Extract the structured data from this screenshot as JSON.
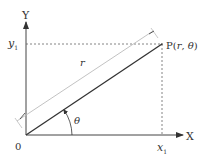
{
  "diagram": {
    "axes": {
      "x_label": "X",
      "y_label": "Y",
      "origin_label": "0"
    },
    "point": {
      "label_prefix": "P(",
      "r": "r",
      "sep": ", ",
      "theta": "θ",
      "label_suffix": ")"
    },
    "projections": {
      "x1_main": "x",
      "x1_sub": "1",
      "y1_main": "y",
      "y1_sub": "1"
    },
    "radius_label": "r",
    "angle_label": "θ",
    "colors": {
      "axis": "#444444",
      "line": "#333333",
      "dashed": "#666666",
      "dimension": "#bbbbbb",
      "text": "#333333"
    }
  }
}
